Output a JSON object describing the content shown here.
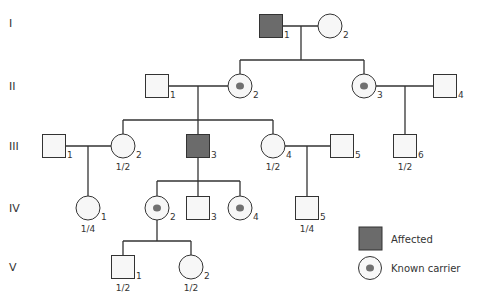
{
  "colors": {
    "line": "#333333",
    "affected_fill": "#6b6b6b",
    "unaffected_fill": "#f7f7f7",
    "carrier_dot": "#707070"
  },
  "generations": [
    {
      "label": "I",
      "y": 23
    },
    {
      "label": "II",
      "y": 86
    },
    {
      "label": "III",
      "y": 146
    },
    {
      "label": "IV",
      "y": 208
    },
    {
      "label": "V",
      "y": 267
    }
  ],
  "individuals": [
    {
      "id": "I-1",
      "num": "1",
      "sex": "male",
      "status": "affected",
      "cx": 271,
      "cy": 26,
      "prob": ""
    },
    {
      "id": "I-2",
      "num": "2",
      "sex": "female",
      "status": "unaffected",
      "cx": 330,
      "cy": 26,
      "prob": ""
    },
    {
      "id": "II-1",
      "num": "1",
      "sex": "male",
      "status": "unaffected",
      "cx": 157,
      "cy": 86,
      "prob": ""
    },
    {
      "id": "II-2",
      "num": "2",
      "sex": "female",
      "status": "carrier",
      "cx": 240,
      "cy": 86,
      "prob": ""
    },
    {
      "id": "II-3",
      "num": "3",
      "sex": "female",
      "status": "carrier",
      "cx": 364,
      "cy": 86,
      "prob": ""
    },
    {
      "id": "II-4",
      "num": "4",
      "sex": "male",
      "status": "unaffected",
      "cx": 445,
      "cy": 86,
      "prob": ""
    },
    {
      "id": "III-1",
      "num": "1",
      "sex": "male",
      "status": "unaffected",
      "cx": 54,
      "cy": 146,
      "prob": ""
    },
    {
      "id": "III-2",
      "num": "2",
      "sex": "female",
      "status": "unaffected",
      "cx": 123,
      "cy": 146,
      "prob": "1/2"
    },
    {
      "id": "III-3",
      "num": "3",
      "sex": "male",
      "status": "affected",
      "cx": 198,
      "cy": 146,
      "prob": ""
    },
    {
      "id": "III-4",
      "num": "4",
      "sex": "female",
      "status": "unaffected",
      "cx": 273,
      "cy": 146,
      "prob": "1/2"
    },
    {
      "id": "III-5",
      "num": "5",
      "sex": "male",
      "status": "unaffected",
      "cx": 342,
      "cy": 146,
      "prob": ""
    },
    {
      "id": "III-6",
      "num": "6",
      "sex": "male",
      "status": "unaffected",
      "cx": 405,
      "cy": 146,
      "prob": "1/2"
    },
    {
      "id": "IV-1",
      "num": "1",
      "sex": "female",
      "status": "unaffected",
      "cx": 88,
      "cy": 208,
      "prob": "1/4"
    },
    {
      "id": "IV-2",
      "num": "2",
      "sex": "female",
      "status": "carrier",
      "cx": 157,
      "cy": 208,
      "prob": ""
    },
    {
      "id": "IV-3",
      "num": "3",
      "sex": "male",
      "status": "unaffected",
      "cx": 198,
      "cy": 208,
      "prob": ""
    },
    {
      "id": "IV-4",
      "num": "4",
      "sex": "female",
      "status": "carrier",
      "cx": 240,
      "cy": 208,
      "prob": ""
    },
    {
      "id": "IV-5",
      "num": "5",
      "sex": "male",
      "status": "unaffected",
      "cx": 307,
      "cy": 208,
      "prob": "1/4"
    },
    {
      "id": "V-1",
      "num": "1",
      "sex": "male",
      "status": "unaffected",
      "cx": 123,
      "cy": 267,
      "prob": "1/2"
    },
    {
      "id": "V-2",
      "num": "2",
      "sex": "female",
      "status": "unaffected",
      "cx": 191,
      "cy": 267,
      "prob": "1/2"
    }
  ],
  "lines": [
    [
      283,
      26,
      318,
      26
    ],
    [
      301,
      26,
      301,
      60
    ],
    [
      240,
      60,
      364,
      60
    ],
    [
      240,
      60,
      240,
      74
    ],
    [
      364,
      60,
      364,
      74
    ],
    [
      168,
      86,
      228,
      86
    ],
    [
      198,
      86,
      198,
      120
    ],
    [
      123,
      120,
      273,
      120
    ],
    [
      123,
      120,
      123,
      134
    ],
    [
      198,
      120,
      198,
      135
    ],
    [
      273,
      120,
      273,
      134
    ],
    [
      376,
      86,
      433,
      86
    ],
    [
      405,
      86,
      405,
      135
    ],
    [
      65,
      146,
      111,
      146
    ],
    [
      88,
      146,
      88,
      196
    ],
    [
      285,
      146,
      330,
      146
    ],
    [
      307,
      146,
      307,
      197
    ],
    [
      198,
      157,
      198,
      181
    ],
    [
      157,
      181,
      240,
      181
    ],
    [
      157,
      181,
      157,
      196
    ],
    [
      198,
      181,
      198,
      197
    ],
    [
      240,
      181,
      240,
      196
    ],
    [
      157,
      220,
      157,
      241
    ],
    [
      123,
      241,
      191,
      241
    ],
    [
      123,
      241,
      123,
      256
    ],
    [
      191,
      241,
      191,
      255
    ]
  ],
  "legend": {
    "affected_label": "Affected",
    "carrier_label": "Known carrier"
  }
}
